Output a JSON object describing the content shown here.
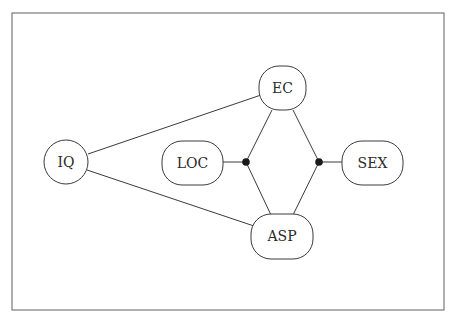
{
  "diagram": {
    "type": "graphical-model",
    "nodes": [
      {
        "id": "IQ",
        "label": "IQ",
        "shape": "circle"
      },
      {
        "id": "EC",
        "label": "EC",
        "shape": "rounded-rect"
      },
      {
        "id": "LOC",
        "label": "LOC",
        "shape": "rounded-rect"
      },
      {
        "id": "SEX",
        "label": "SEX",
        "shape": "rounded-rect"
      },
      {
        "id": "ASP",
        "label": "ASP",
        "shape": "rounded-rect"
      }
    ],
    "junctions": [
      {
        "id": "j1",
        "connects": [
          "LOC",
          "EC",
          "ASP"
        ]
      },
      {
        "id": "j2",
        "connects": [
          "SEX",
          "EC",
          "ASP"
        ]
      }
    ],
    "edges": [
      {
        "from": "IQ",
        "to": "EC"
      },
      {
        "from": "IQ",
        "to": "ASP"
      },
      {
        "from": "LOC",
        "to": "j1"
      },
      {
        "from": "j1",
        "to": "EC"
      },
      {
        "from": "j1",
        "to": "ASP"
      },
      {
        "from": "SEX",
        "to": "j2"
      },
      {
        "from": "j2",
        "to": "EC"
      },
      {
        "from": "j2",
        "to": "ASP"
      }
    ]
  }
}
